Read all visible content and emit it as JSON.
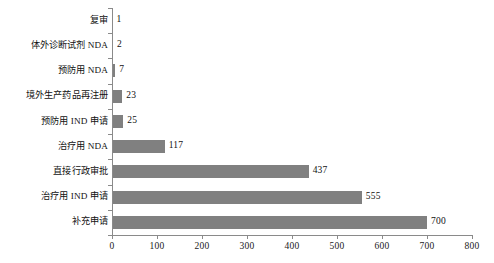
{
  "chart_data": {
    "type": "bar",
    "orientation": "horizontal",
    "title": "",
    "xlabel": "",
    "ylabel": "",
    "xlim": [
      0,
      800
    ],
    "xticks": [
      0,
      100,
      200,
      300,
      400,
      500,
      600,
      700,
      800
    ],
    "xtick_labels": [
      "0",
      "100",
      "200",
      "300",
      "400",
      "500",
      "600",
      "700",
      "800"
    ],
    "grid": false,
    "legend": false,
    "bar_color": "#808080",
    "axis_color": "#8a8a8a",
    "categories": [
      "复审",
      "体外诊断试剂 NDA",
      "预防用 NDA",
      "境外生产药品再注册",
      "预防用 IND 申请",
      "治疗用 NDA",
      "直接行政审批",
      "治疗用 IND 申请",
      "补充申请"
    ],
    "values": [
      1,
      2,
      7,
      23,
      25,
      117,
      437,
      555,
      700
    ],
    "value_labels": [
      "1",
      "2",
      "7",
      "23",
      "25",
      "117",
      "437",
      "555",
      "700"
    ]
  }
}
